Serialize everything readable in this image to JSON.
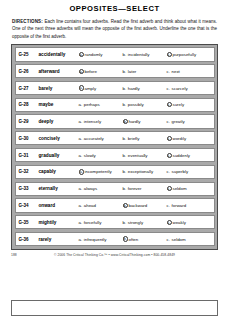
{
  "worksheet": {
    "title": "OPPOSITES—SELECT",
    "directions_lead": "DIRECTIONS:",
    "directions_body": " Each line contains four adverbs. Read the first adverb and think about what it means. One of the next three adverbs will mean the opposite of the first adverb. Underline the one that is the opposite of the first adverb."
  },
  "rows": [
    {
      "code": "G-25",
      "word": "accidentally",
      "options": [
        {
          "letter": "a.",
          "text": "randomly",
          "circled": false
        },
        {
          "letter": "b.",
          "text": "incidentally",
          "circled": false
        },
        {
          "letter": "c.",
          "text": "purposefully",
          "circled": true
        }
      ]
    },
    {
      "code": "G-26",
      "word": "afterward",
      "options": [
        {
          "letter": "a.",
          "text": "before",
          "circled": true
        },
        {
          "letter": "b.",
          "text": "later",
          "circled": false
        },
        {
          "letter": "c.",
          "text": "next",
          "circled": false
        }
      ]
    },
    {
      "code": "G-27",
      "word": "barely",
      "options": [
        {
          "letter": "a.",
          "text": "amply",
          "circled": true
        },
        {
          "letter": "b.",
          "text": "hardly",
          "circled": false
        },
        {
          "letter": "c.",
          "text": "scarcely",
          "circled": false
        }
      ]
    },
    {
      "code": "G-28",
      "word": "maybe",
      "options": [
        {
          "letter": "a.",
          "text": "perhaps",
          "circled": false
        },
        {
          "letter": "b.",
          "text": "possibly",
          "circled": false
        },
        {
          "letter": "c.",
          "text": "surely",
          "circled": true
        }
      ]
    },
    {
      "code": "G-29",
      "word": "deeply",
      "options": [
        {
          "letter": "a.",
          "text": "intensely",
          "circled": false
        },
        {
          "letter": "b.",
          "text": "hardly",
          "circled": true
        },
        {
          "letter": "c.",
          "text": "greatly",
          "circled": false
        }
      ]
    },
    {
      "code": "G-30",
      "word": "concisely",
      "options": [
        {
          "letter": "a.",
          "text": "accurately",
          "circled": false
        },
        {
          "letter": "b.",
          "text": "briefly",
          "circled": false
        },
        {
          "letter": "c.",
          "text": "wordily",
          "circled": true
        }
      ]
    },
    {
      "code": "G-31",
      "word": "gradually",
      "options": [
        {
          "letter": "a.",
          "text": "slowly",
          "circled": false
        },
        {
          "letter": "b.",
          "text": "eventually",
          "circled": false
        },
        {
          "letter": "c.",
          "text": "suddenly",
          "circled": true
        }
      ]
    },
    {
      "code": "G-32",
      "word": "capably",
      "options": [
        {
          "letter": "a.",
          "text": "incompetently",
          "circled": true
        },
        {
          "letter": "b.",
          "text": "exceptionally",
          "circled": false
        },
        {
          "letter": "c.",
          "text": "superbly",
          "circled": false
        }
      ]
    },
    {
      "code": "G-33",
      "word": "eternally",
      "options": [
        {
          "letter": "a.",
          "text": "always",
          "circled": false
        },
        {
          "letter": "b.",
          "text": "forever",
          "circled": false
        },
        {
          "letter": "c.",
          "text": "seldom",
          "circled": true
        }
      ]
    },
    {
      "code": "G-34",
      "word": "onward",
      "options": [
        {
          "letter": "a.",
          "text": "ahead",
          "circled": false
        },
        {
          "letter": "b.",
          "text": "backward",
          "circled": true
        },
        {
          "letter": "c.",
          "text": "forward",
          "circled": false
        }
      ]
    },
    {
      "code": "G-35",
      "word": "mightily",
      "options": [
        {
          "letter": "a.",
          "text": "forcefully",
          "circled": false
        },
        {
          "letter": "b.",
          "text": "strongly",
          "circled": false
        },
        {
          "letter": "c.",
          "text": "weakly",
          "circled": true
        }
      ]
    },
    {
      "code": "G-36",
      "word": "rarely",
      "options": [
        {
          "letter": "a.",
          "text": "infrequently",
          "circled": false
        },
        {
          "letter": "b.",
          "text": "often",
          "circled": true
        },
        {
          "letter": "c.",
          "text": "seldom",
          "circled": false
        }
      ]
    }
  ],
  "footer": {
    "page_number": "188",
    "copyright": "© 2006 The Critical Thinking Co.™ • www.CriticalThinking.com • 800-458-4849"
  }
}
